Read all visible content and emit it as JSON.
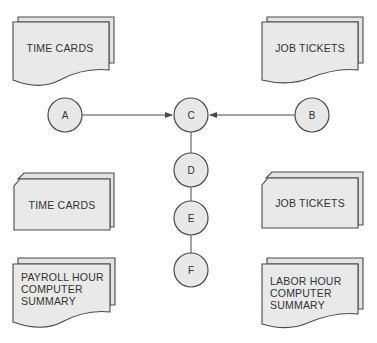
{
  "diagram": {
    "type": "flowchart",
    "documents": {
      "top_left": {
        "label": "TIME CARDS",
        "shape": "document"
      },
      "top_right": {
        "label": "JOB TICKETS",
        "shape": "document"
      },
      "mid_left": {
        "label": "TIME CARDS",
        "shape": "card"
      },
      "mid_right": {
        "label": "JOB TICKETS",
        "shape": "card"
      },
      "bottom_left": {
        "lines": [
          "PAYROLL HOUR",
          "COMPUTER",
          "SUMMARY"
        ],
        "shape": "document"
      },
      "bottom_right": {
        "lines": [
          "LABOR HOUR",
          "COMPUTER",
          "SUMMARY"
        ],
        "shape": "document"
      }
    },
    "nodes": {
      "a": "A",
      "b": "B",
      "c": "C",
      "d": "D",
      "e": "E",
      "f": "F"
    },
    "edges": [
      {
        "from": "A",
        "to": "C",
        "arrow": true
      },
      {
        "from": "B",
        "to": "C",
        "arrow": true
      },
      {
        "from": "C",
        "to": "D",
        "arrow": false
      },
      {
        "from": "D",
        "to": "E",
        "arrow": false
      },
      {
        "from": "E",
        "to": "F",
        "arrow": false
      }
    ],
    "colors": {
      "fill": "#e9e9e9",
      "stroke": "#4a4a4a",
      "text": "#333333"
    }
  }
}
